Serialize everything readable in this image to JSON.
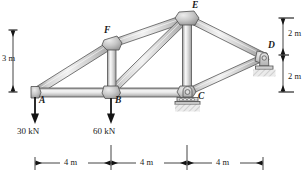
{
  "figure": {
    "type": "statics-truss-free-body-diagram",
    "background_color": "#ffffff",
    "member_fill_light": "#e8e8e8",
    "member_fill_mid": "#c9c9c9",
    "member_fill_dark": "#9a9a9a",
    "outline_color": "#4d4d4d",
    "annotation_color": "#1a1a1a"
  },
  "nodes": [
    {
      "id": "A",
      "label": "A",
      "x": 35,
      "y": 92,
      "label_x": 39,
      "label_y": 96
    },
    {
      "id": "B",
      "label": "B",
      "x": 111,
      "y": 92,
      "label_x": 115,
      "label_y": 96
    },
    {
      "id": "C",
      "label": "C",
      "x": 187,
      "y": 92,
      "label_x": 196,
      "label_y": 95
    },
    {
      "id": "D",
      "label": "D",
      "x": 263,
      "y": 57,
      "label_x": 268,
      "label_y": 45
    },
    {
      "id": "E",
      "label": "E",
      "x": 187,
      "y": 18,
      "label_x": 192,
      "label_y": 3
    },
    {
      "id": "F",
      "label": "F",
      "x": 112,
      "y": 44,
      "label_x": 106,
      "label_y": 29
    }
  ],
  "members": [
    {
      "from": "A",
      "to": "B",
      "name": "bottom-chord-ab"
    },
    {
      "from": "B",
      "to": "C",
      "name": "bottom-chord-bc"
    },
    {
      "from": "A",
      "to": "F",
      "name": "top-chord-af"
    },
    {
      "from": "F",
      "to": "E",
      "name": "top-chord-fe"
    },
    {
      "from": "F",
      "to": "B",
      "name": "vertical-fb"
    },
    {
      "from": "B",
      "to": "E",
      "name": "diagonal-be"
    },
    {
      "from": "E",
      "to": "C",
      "name": "vertical-ec"
    },
    {
      "from": "E",
      "to": "D",
      "name": "top-chord-ed"
    },
    {
      "from": "C",
      "to": "D",
      "name": "bottom-chord-cd"
    }
  ],
  "loads": [
    {
      "at": "A",
      "label": "30 kN",
      "magnitude": 30,
      "unit": "kN",
      "direction": "down",
      "x": 35,
      "label_x": 35,
      "label_y": 130
    },
    {
      "at": "B",
      "label": "60 kN",
      "magnitude": 60,
      "unit": "kN",
      "direction": "down",
      "x": 111,
      "label_x": 111,
      "label_y": 130
    }
  ],
  "supports": [
    {
      "at": "C",
      "type": "roller",
      "name": "roller-support-c"
    },
    {
      "at": "D",
      "type": "rocker-pin",
      "name": "pin-support-d"
    }
  ],
  "dimensions": {
    "vertical_left": {
      "label": "3 m",
      "value": 3,
      "unit": "m",
      "label_x": 7,
      "label_y": 58
    },
    "vertical_right_upper": {
      "label": "2 m",
      "value": 2,
      "unit": "m",
      "label_x": 288,
      "label_y": 33
    },
    "vertical_right_lower": {
      "label": "2 m",
      "value": 2,
      "unit": "m",
      "label_x": 288,
      "label_y": 76
    },
    "horizontal": [
      {
        "label": "4 m",
        "value": 4,
        "unit": "m",
        "label_x": 73,
        "label_y": 152
      },
      {
        "label": "4 m",
        "value": 4,
        "unit": "m",
        "label_x": 149,
        "label_y": 152
      },
      {
        "label": "4 m",
        "value": 4,
        "unit": "m",
        "label_x": 225,
        "label_y": 152
      }
    ]
  }
}
